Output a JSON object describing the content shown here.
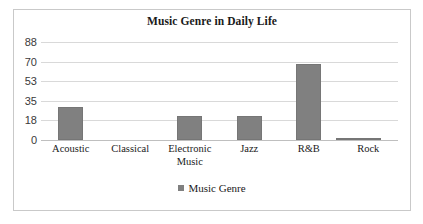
{
  "chart_data": {
    "type": "bar",
    "title": "Music Genre in Daily Life",
    "xlabel": "",
    "ylabel": "",
    "categories": [
      "Acoustic",
      "Classical",
      "Electronic Music",
      "Jazz",
      "R&B",
      "Rock"
    ],
    "category_lines": [
      [
        "Acoustic"
      ],
      [
        "Classical"
      ],
      [
        "Electronic",
        "Music"
      ],
      [
        "Jazz"
      ],
      [
        "R&B"
      ],
      [
        "Rock"
      ]
    ],
    "values": [
      30,
      0,
      22,
      22,
      68,
      1
    ],
    "extra_values": [
      2
    ],
    "series": [
      {
        "name": "Music Genre",
        "values": [
          30,
          0,
          22,
          22,
          68,
          1
        ]
      }
    ],
    "yticks": [
      0,
      18,
      35,
      53,
      70,
      88
    ],
    "ytick_labels": [
      "0",
      "18",
      "35",
      "53",
      "70",
      "88"
    ],
    "ylim": [
      0,
      88
    ],
    "grid": true,
    "legend": {
      "position": "bottom",
      "entries": [
        "Music Genre"
      ]
    },
    "bar_color": "#808080",
    "gridline_color": "#d9d9d9",
    "frame_color": "#c9c9c9"
  },
  "legend": {
    "label": "Music Genre"
  }
}
